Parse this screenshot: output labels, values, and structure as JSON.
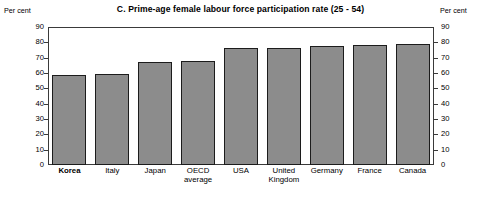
{
  "chart_data": {
    "type": "bar",
    "title": "C.  Prime-age female labour force participation rate (25 - 54)",
    "xlabel": "",
    "ylabel": "Per cent",
    "unit_caption_left": "Per cent",
    "unit_caption_right": "Per cent",
    "ylim": [
      0,
      90
    ],
    "yticks": [
      0,
      10,
      20,
      30,
      40,
      50,
      60,
      70,
      80,
      90
    ],
    "ytick_labels": [
      "0",
      "10",
      "20",
      "30",
      "40",
      "50",
      "60",
      "70",
      "80",
      "90"
    ],
    "grid": false,
    "legend": null,
    "dual_axis": true,
    "categories": [
      "Korea",
      "Italy",
      "Japan",
      "OECD\naverage",
      "USA",
      "United\nKingdom",
      "Germany",
      "France",
      "Canada"
    ],
    "values": [
      58.5,
      59.5,
      67.0,
      68.0,
      76.0,
      76.0,
      77.5,
      78.0,
      79.0
    ],
    "highlight_category": "Korea",
    "bar_color": "#8c8c8c",
    "bar_border_color": "#1c1c1c",
    "frame_color": "#3a3a3a",
    "background_color": "#ffffff"
  }
}
